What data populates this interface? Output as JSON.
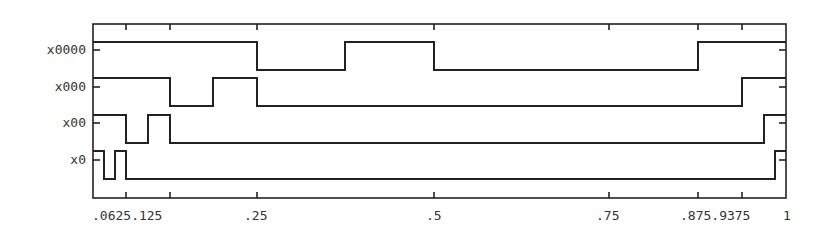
{
  "chart_data": {
    "type": "line",
    "subtype": "step",
    "title": "",
    "xlabel": "",
    "ylabel": "",
    "xlim": [
      0,
      1
    ],
    "grid": false,
    "legend": null,
    "x_ticks": [
      {
        "value": 0.0625,
        "label": ".0625",
        "px": 126
      },
      {
        "value": 0.125,
        "label": ".125",
        "px": 170
      },
      {
        "value": 0.25,
        "label": ".25",
        "px": 257
      },
      {
        "value": 0.5,
        "label": ".5",
        "px": 434
      },
      {
        "value": 0.75,
        "label": ".75",
        "px": 609
      },
      {
        "value": 0.875,
        "label": ".875",
        "px": 698
      },
      {
        "value": 0.9375,
        "label": ".9375",
        "px": 742
      },
      {
        "value": 1,
        "label": "1",
        "px": 786
      }
    ],
    "x_tick_label_text": ".0625.125",
    "x_tick_label_groups": [
      {
        "text": ".0625.125",
        "x": 92
      },
      {
        "text": ".25",
        "x": 244
      },
      {
        "text": ".5",
        "x": 426
      },
      {
        "text": ".75",
        "x": 596
      },
      {
        "text": ".875.9375",
        "x": 680
      },
      {
        "text": "1",
        "x": 783
      }
    ],
    "series": [
      {
        "name": "x0000",
        "label_y": 50,
        "high_y": 42,
        "low_y": 70,
        "steps_px": [
          [
            93,
            "high"
          ],
          [
            257,
            "low"
          ],
          [
            345,
            "high"
          ],
          [
            434,
            "low"
          ],
          [
            698,
            "high"
          ],
          [
            786,
            "end"
          ]
        ],
        "levels": [
          1,
          0,
          1,
          0,
          1
        ]
      },
      {
        "name": "x000",
        "label_y": 87,
        "high_y": 78,
        "low_y": 106,
        "steps_px": [
          [
            93,
            "high"
          ],
          [
            170,
            "low"
          ],
          [
            213,
            "high"
          ],
          [
            257,
            "low"
          ],
          [
            742,
            "high"
          ],
          [
            786,
            "end"
          ]
        ],
        "levels": [
          1,
          0,
          1,
          0,
          1
        ]
      },
      {
        "name": "x00",
        "label_y": 123,
        "high_y": 115,
        "low_y": 143,
        "steps_px": [
          [
            93,
            "high"
          ],
          [
            126,
            "low"
          ],
          [
            148,
            "high"
          ],
          [
            170,
            "low"
          ],
          [
            764,
            "high"
          ],
          [
            786,
            "end"
          ]
        ],
        "levels": [
          1,
          0,
          1,
          0,
          1
        ]
      },
      {
        "name": "x0",
        "label_y": 160,
        "high_y": 151,
        "low_y": 179,
        "steps_px": [
          [
            93,
            "high"
          ],
          [
            104,
            "low"
          ],
          [
            115,
            "high"
          ],
          [
            126,
            "low"
          ],
          [
            775,
            "high"
          ],
          [
            786,
            "end"
          ]
        ],
        "levels": [
          1,
          0,
          1,
          0,
          1
        ]
      }
    ],
    "y_tick_labels": [
      "x0000",
      "x000",
      "x00",
      "x0"
    ]
  },
  "frame": {
    "left": 93,
    "top": 24,
    "right": 786,
    "bottom": 198
  },
  "colors": {
    "line": "#222222",
    "text": "#333333",
    "background": "#ffffff"
  }
}
